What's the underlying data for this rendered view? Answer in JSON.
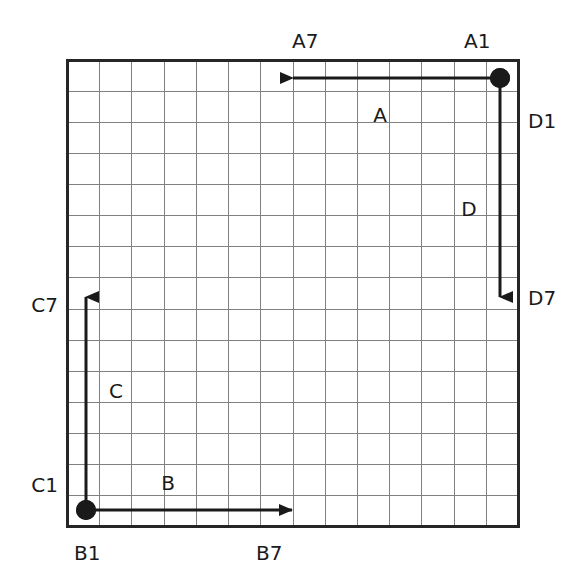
{
  "figure": {
    "type": "grid-vector-diagram",
    "background_color": "#ffffff",
    "ink_color": "#1a1a1a",
    "gridline_color": "#808080",
    "border_color": "#262626",
    "grid": {
      "columns": 14,
      "rows": 15,
      "cell_size_px": 32,
      "left_px": 67,
      "top_px": 60,
      "right_px": 518,
      "bottom_px": 526
    }
  },
  "corner_labels": {
    "top_left_of_top_arrow": "A7",
    "top_right": "A1",
    "right_upper": "D1",
    "right_lower": "D7",
    "left_upper": "C7",
    "left_lower": "C1",
    "bottom_left": "B1",
    "bottom_middle": "B7"
  },
  "vectors": [
    {
      "name": "A",
      "label": "A",
      "direction": "left",
      "start_label": "A1",
      "end_label": "A7",
      "start_px": {
        "x": 500,
        "y": 78
      },
      "end_px": {
        "x": 293,
        "y": 78
      },
      "length_cells": 6.5,
      "has_start_dot": true,
      "label_px": {
        "x": 380,
        "y": 122
      }
    },
    {
      "name": "D",
      "label": "D",
      "direction": "down",
      "start_label": "D1",
      "end_label": "D7",
      "start_px": {
        "x": 500,
        "y": 78
      },
      "end_px": {
        "x": 500,
        "y": 297
      },
      "length_cells": 6.9,
      "has_start_dot": true,
      "label_px": {
        "x": 469,
        "y": 216
      }
    },
    {
      "name": "C",
      "label": "C",
      "direction": "up",
      "start_label": "C1",
      "end_label": "C7",
      "start_px": {
        "x": 86,
        "y": 510
      },
      "end_px": {
        "x": 86,
        "y": 297
      },
      "length_cells": 6.7,
      "has_start_dot": true,
      "label_px": {
        "x": 116,
        "y": 398
      }
    },
    {
      "name": "B",
      "label": "B",
      "direction": "right",
      "start_label": "B1",
      "end_label": "B7",
      "start_px": {
        "x": 86,
        "y": 510
      },
      "end_px": {
        "x": 292,
        "y": 510
      },
      "length_cells": 6.4,
      "has_start_dot": true,
      "label_px": {
        "x": 168,
        "y": 490
      }
    }
  ],
  "axis_labels": [
    {
      "id": "label-a7",
      "text": "A7",
      "x": 292,
      "y": 48,
      "anchor": "start"
    },
    {
      "id": "label-a1",
      "text": "A1",
      "x": 464,
      "y": 48,
      "anchor": "start"
    },
    {
      "id": "label-d1",
      "text": "D1",
      "x": 528,
      "y": 128,
      "anchor": "start"
    },
    {
      "id": "label-d7",
      "text": "D7",
      "x": 528,
      "y": 305,
      "anchor": "start"
    },
    {
      "id": "label-c7",
      "text": "C7",
      "x": 58,
      "y": 312,
      "anchor": "end"
    },
    {
      "id": "label-c1",
      "text": "C1",
      "x": 58,
      "y": 492,
      "anchor": "end"
    },
    {
      "id": "label-b1",
      "text": "B1",
      "x": 74,
      "y": 560,
      "anchor": "start"
    },
    {
      "id": "label-b7",
      "text": "B7",
      "x": 256,
      "y": 560,
      "anchor": "start"
    }
  ]
}
